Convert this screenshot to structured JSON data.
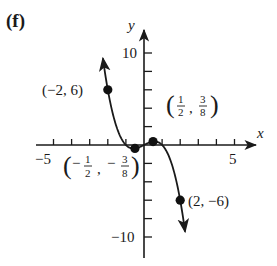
{
  "chart_data": {
    "type": "line",
    "panel_label": "(f)",
    "title": "",
    "function": "y = x - x^3",
    "xlabel": "x",
    "ylabel": "y",
    "xlim": [
      -5.5,
      6
    ],
    "ylim": [
      -12,
      12
    ],
    "x_ticks": [
      -5,
      -4,
      -3,
      -2,
      -1,
      1,
      2,
      3,
      4,
      5
    ],
    "y_ticks": [
      -10,
      -8,
      -6,
      -4,
      -2,
      2,
      4,
      6,
      8,
      10
    ],
    "x_tick_labels": [
      {
        "value": -5,
        "text": "−5"
      },
      {
        "value": 5,
        "text": "5"
      }
    ],
    "y_tick_labels": [
      {
        "value": 10,
        "text": "10"
      },
      {
        "value": -10,
        "text": "−10"
      }
    ],
    "grid": false,
    "legend": null,
    "series": [
      {
        "name": "curve",
        "color": "#1a1a1a",
        "arrows": "both-ends",
        "x": [
          -2.3,
          -2,
          -1.5,
          -1,
          -0.5,
          0,
          0.5,
          1,
          1.5,
          2,
          2.3
        ],
        "y": [
          9.867,
          6,
          1.875,
          0,
          -0.375,
          0,
          0.375,
          0,
          -1.875,
          -6,
          -9.867
        ]
      }
    ],
    "marked_points": [
      {
        "x": -2,
        "y": 6,
        "label": "(−2, 6)"
      },
      {
        "x": -0.5,
        "y": -0.375,
        "label": "(−1/2, −3/8)",
        "num_x": "1",
        "den_x": "2",
        "num_y": "3",
        "den_y": "8",
        "sign_x": "−",
        "sign_y": "−"
      },
      {
        "x": 0.5,
        "y": 0.375,
        "label": "(1/2, 3/8)",
        "num_x": "1",
        "den_x": "2",
        "num_y": "3",
        "den_y": "8"
      },
      {
        "x": 2,
        "y": -6,
        "label": "(2, −6)"
      }
    ]
  },
  "labels": {
    "panel": "(f)",
    "x_axis": "x",
    "y_axis": "y",
    "x_tick_neg5": "−5",
    "x_tick_5": "5",
    "y_tick_10": "10",
    "y_tick_neg10": "−10",
    "pt_a": "(−2, 6)",
    "pt_d": "(2, −6)",
    "frac_one": "1",
    "frac_two": "2",
    "frac_three": "3",
    "frac_eight": "8",
    "minus": "−",
    "comma": ",",
    "lparen": "(",
    "rparen": ")"
  }
}
